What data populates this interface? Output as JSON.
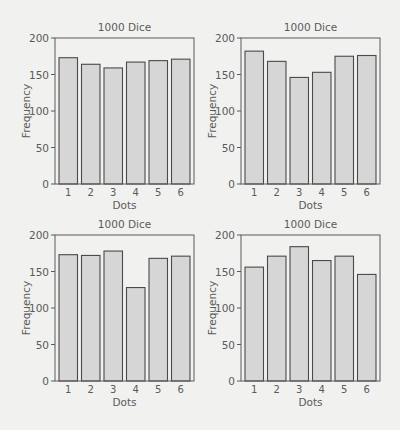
{
  "colors": {
    "background": "#f1f1ef",
    "bar_fill": "#d6d6d6",
    "bar_stroke": "#4a4a4a",
    "axis": "#5a5a5a",
    "text": "#5a5a5a"
  },
  "chart_data": [
    {
      "type": "bar",
      "title": "1000 Dice",
      "xlabel": "Dots",
      "ylabel": "Frequency",
      "categories": [
        "1",
        "2",
        "3",
        "4",
        "5",
        "6"
      ],
      "values": [
        173,
        164,
        159,
        167,
        169,
        171
      ],
      "ylim": [
        0,
        200
      ],
      "yticks": [
        0,
        50,
        100,
        150,
        200
      ],
      "grid": false,
      "legend": null,
      "position": "top-left"
    },
    {
      "type": "bar",
      "title": "1000 Dice",
      "xlabel": "Dots",
      "ylabel": "Frequency",
      "categories": [
        "1",
        "2",
        "3",
        "4",
        "5",
        "6"
      ],
      "values": [
        182,
        168,
        146,
        153,
        175,
        176
      ],
      "ylim": [
        0,
        200
      ],
      "yticks": [
        0,
        50,
        100,
        150,
        200
      ],
      "grid": false,
      "legend": null,
      "position": "top-right"
    },
    {
      "type": "bar",
      "title": "1000 Dice",
      "xlabel": "Dots",
      "ylabel": "Frequency",
      "categories": [
        "1",
        "2",
        "3",
        "4",
        "5",
        "6"
      ],
      "values": [
        173,
        172,
        178,
        128,
        168,
        171
      ],
      "ylim": [
        0,
        200
      ],
      "yticks": [
        0,
        50,
        100,
        150,
        200
      ],
      "grid": false,
      "legend": null,
      "position": "bottom-left"
    },
    {
      "type": "bar",
      "title": "1000 Dice",
      "xlabel": "Dots",
      "ylabel": "Frequency",
      "categories": [
        "1",
        "2",
        "3",
        "4",
        "5",
        "6"
      ],
      "values": [
        156,
        171,
        184,
        165,
        171,
        146
      ],
      "ylim": [
        0,
        200
      ],
      "yticks": [
        0,
        50,
        100,
        150,
        200
      ],
      "grid": false,
      "legend": null,
      "position": "bottom-right"
    }
  ]
}
